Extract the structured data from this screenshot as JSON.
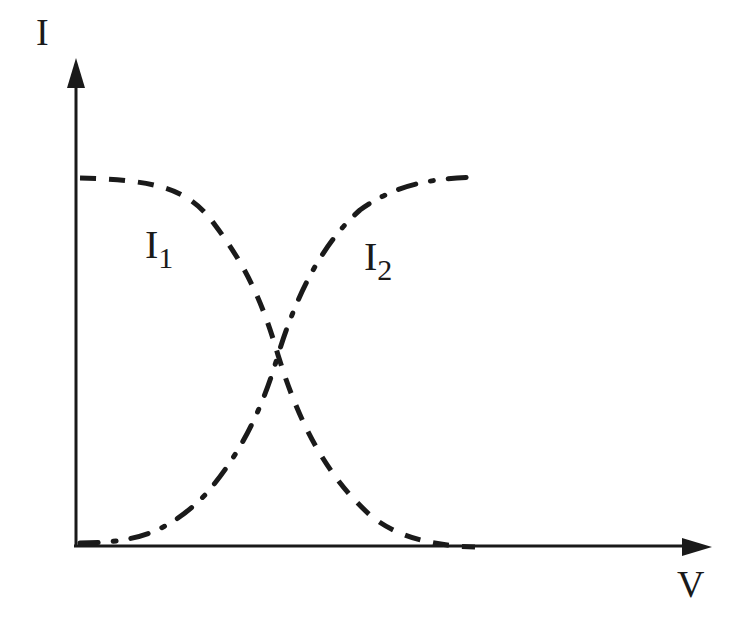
{
  "axes": {
    "y_label": "I",
    "x_label": "V"
  },
  "curves": [
    {
      "name": "I",
      "subscript": "1",
      "style": "dashed",
      "trend": "decreasing sigmoid"
    },
    {
      "name": "I",
      "subscript": "2",
      "style": "dash-dot",
      "trend": "increasing sigmoid"
    }
  ],
  "colors": {
    "ink": "#1a1a1a",
    "background": "#ffffff"
  }
}
